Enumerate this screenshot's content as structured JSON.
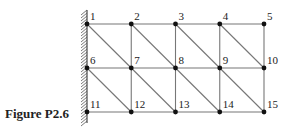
{
  "caption": "Figure P2.6",
  "colors": {
    "line": "#777777",
    "node": "#111111",
    "wall": "#555555",
    "text": "#222222"
  },
  "grid": {
    "cols": 5,
    "rows": 3,
    "origin": [
      87,
      24
    ],
    "dx": 44.25,
    "dy": 44
  },
  "nodes": [
    {
      "id": 1,
      "label": "1",
      "col": 0,
      "row": 0
    },
    {
      "id": 2,
      "label": "2",
      "col": 1,
      "row": 0
    },
    {
      "id": 3,
      "label": "3",
      "col": 2,
      "row": 0
    },
    {
      "id": 4,
      "label": "4",
      "col": 3,
      "row": 0
    },
    {
      "id": 5,
      "label": "5",
      "col": 4,
      "row": 0
    },
    {
      "id": 6,
      "label": "6",
      "col": 0,
      "row": 1
    },
    {
      "id": 7,
      "label": "7",
      "col": 1,
      "row": 1
    },
    {
      "id": 8,
      "label": "8",
      "col": 2,
      "row": 1
    },
    {
      "id": 9,
      "label": "9",
      "col": 3,
      "row": 1
    },
    {
      "id": 10,
      "label": "10",
      "col": 4,
      "row": 1
    },
    {
      "id": 11,
      "label": "11",
      "col": 0,
      "row": 2
    },
    {
      "id": 12,
      "label": "12",
      "col": 1,
      "row": 2
    },
    {
      "id": 13,
      "label": "13",
      "col": 2,
      "row": 2
    },
    {
      "id": 14,
      "label": "14",
      "col": 3,
      "row": 2
    },
    {
      "id": 15,
      "label": "15",
      "col": 4,
      "row": 2
    }
  ],
  "elements_description": "Triangular finite element mesh: 4x2 rectangular cells each split by a diagonal from top-left to bottom-right; left edge (nodes 1, 6, 11) fixed to a hatched wall.",
  "support": {
    "type": "fixed-wall",
    "side": "left",
    "nodes": [
      1,
      6,
      11
    ]
  }
}
